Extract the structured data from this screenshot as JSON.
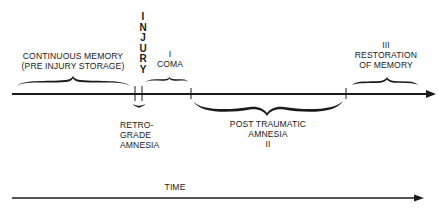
{
  "diagram": {
    "injury_label": [
      "I",
      "N",
      "J",
      "U",
      "R",
      "Y"
    ],
    "continuous_memory": {
      "line1": "CONTINUOUS MEMORY",
      "line2": "(PRE INJURY STORAGE)"
    },
    "coma": {
      "numeral": "I",
      "label": "COMA"
    },
    "retrograde": {
      "line1": "RETRO-",
      "line2": "GRADE",
      "line3": "AMNESIA"
    },
    "post_traumatic": {
      "line1": "POST TRAUMATIC",
      "line2": "AMNESIA",
      "numeral": "II"
    },
    "restoration": {
      "numeral": "III",
      "line1": "RESTORATION",
      "line2": "OF MEMORY"
    },
    "time_axis": {
      "label": "TIME"
    },
    "colors": {
      "ink": "#1a1a1a",
      "background": "#ffffff"
    }
  }
}
